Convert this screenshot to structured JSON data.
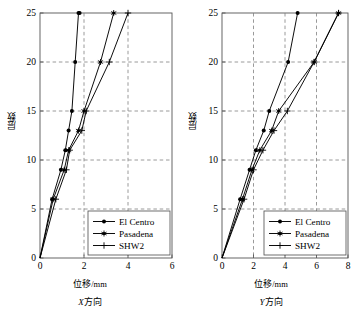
{
  "chart_data": [
    {
      "type": "line",
      "title": "",
      "subtitle": "X方向",
      "xlabel": "位移/mm",
      "ylabel": "层数",
      "xlim": [
        0,
        6
      ],
      "ylim": [
        0,
        25
      ],
      "xticks": [
        0,
        2,
        4,
        6
      ],
      "yticks": [
        0,
        5,
        10,
        15,
        20,
        25
      ],
      "grid": true,
      "legend_position": "lower-right",
      "orientation": "y-is-floor",
      "series": [
        {
          "name": "El Centro",
          "marker": "filled-circle",
          "x": [
            0,
            0.55,
            0.95,
            1.15,
            1.3,
            1.45,
            1.6,
            1.75,
            1.8
          ],
          "y": [
            0,
            6,
            9,
            11,
            13,
            15,
            20,
            25,
            25
          ]
        },
        {
          "name": "Pasadena",
          "marker": "asterisk",
          "x": [
            0,
            0.6,
            1.1,
            1.3,
            1.75,
            2.0,
            2.75,
            3.35
          ],
          "y": [
            0,
            6,
            9,
            11,
            13,
            15,
            20,
            25
          ]
        },
        {
          "name": "SHW2",
          "marker": "plus",
          "x": [
            0,
            0.72,
            1.2,
            1.35,
            1.9,
            2.1,
            3.15,
            4.0
          ],
          "y": [
            0,
            6,
            9,
            11,
            13,
            15,
            20,
            25
          ]
        }
      ]
    },
    {
      "type": "line",
      "title": "",
      "subtitle": "Y方向",
      "xlabel": "位移/mm",
      "ylabel": "层数",
      "xlim": [
        0,
        8
      ],
      "ylim": [
        0,
        25
      ],
      "xticks": [
        0,
        2,
        4,
        6,
        8
      ],
      "yticks": [
        0,
        5,
        10,
        15,
        20,
        25
      ],
      "grid": true,
      "legend_position": "lower-right",
      "orientation": "y-is-floor",
      "series": [
        {
          "name": "El Centro",
          "marker": "filled-circle",
          "x": [
            0,
            1.15,
            1.75,
            2.15,
            2.65,
            3.0,
            4.2,
            4.8
          ],
          "y": [
            0,
            6,
            9,
            11,
            13,
            15,
            20,
            25
          ]
        },
        {
          "name": "Pasadena",
          "marker": "asterisk",
          "x": [
            0,
            1.3,
            1.9,
            2.4,
            3.15,
            3.6,
            5.85,
            7.4
          ],
          "y": [
            0,
            6,
            9,
            11,
            13,
            15,
            20,
            25
          ]
        },
        {
          "name": "SHW2",
          "marker": "plus",
          "x": [
            0,
            1.4,
            2.0,
            2.6,
            3.3,
            4.15,
            5.85,
            7.4
          ],
          "y": [
            0,
            6,
            9,
            11,
            13,
            15,
            20,
            25
          ]
        }
      ]
    }
  ],
  "panels": [
    {
      "id": "x-direction",
      "xlabel_text": "位移",
      "xlabel_unit": "/mm",
      "ylabel_text": "层数",
      "caption_prefix": "X",
      "caption_suffix": "方向",
      "xticks": [
        "0",
        "2",
        "4",
        "6"
      ],
      "yticks": [
        "0",
        "5",
        "10",
        "15",
        "20",
        "25"
      ],
      "legend": [
        {
          "label": "El Centro",
          "marker": "filled-circle"
        },
        {
          "label": "Pasadena",
          "marker": "asterisk"
        },
        {
          "label": "SHW2",
          "marker": "plus"
        }
      ]
    },
    {
      "id": "y-direction",
      "xlabel_text": "位移",
      "xlabel_unit": "/mm",
      "ylabel_text": "层数",
      "caption_prefix": "Y",
      "caption_suffix": "方向",
      "xticks": [
        "0",
        "2",
        "4",
        "6",
        "8"
      ],
      "yticks": [
        "0",
        "5",
        "10",
        "15",
        "20",
        "25"
      ],
      "legend": [
        {
          "label": "El Centro",
          "marker": "filled-circle"
        },
        {
          "label": "Pasadena",
          "marker": "asterisk"
        },
        {
          "label": "SHW2",
          "marker": "plus"
        }
      ]
    }
  ],
  "colors": {
    "line": "#000000",
    "grid": "#808080",
    "axis": "#555555",
    "background": "#ffffff"
  }
}
